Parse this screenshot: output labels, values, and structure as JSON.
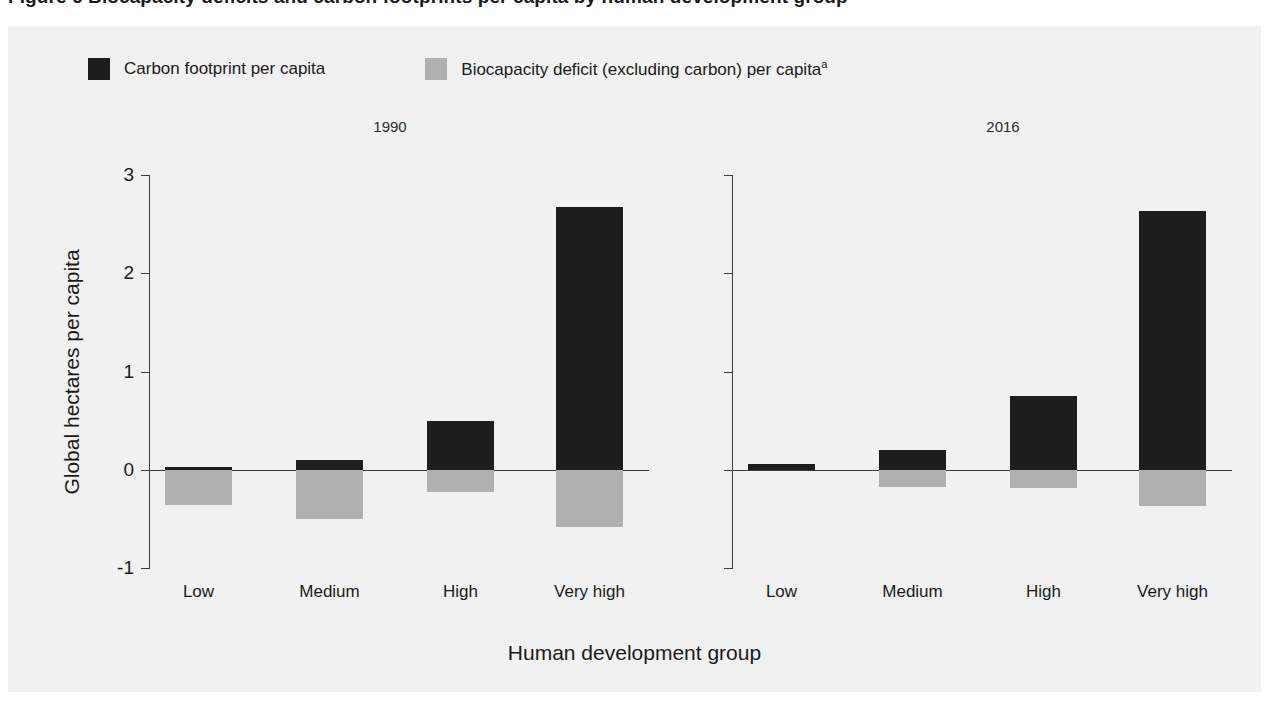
{
  "figure": {
    "title": "Figure 6  Biocapacity deficits and carbon footprints per capita by human development group",
    "xlabel": "Human development group",
    "ylabel": "Global hectares per capita"
  },
  "legend": {
    "position": "top-left",
    "items": [
      {
        "label": "Carbon footprint per capita",
        "color": "#1d1d1d",
        "superscript": ""
      },
      {
        "label": "Biocapacity deficit (excluding carbon) per capita",
        "color": "#b0b0b0",
        "superscript": "a"
      }
    ]
  },
  "colors": {
    "carbon": "#1d1d1d",
    "biocapacity": "#b0b0b0",
    "axis": "#3c3c3c",
    "background": "#f1f1f1",
    "text": "#1a1a1a"
  },
  "chart_data": {
    "type": "bar",
    "title": "Biocapacity deficits and carbon footprints per capita by human development group",
    "xlabel": "Human development group",
    "ylabel": "Global hectares per capita",
    "ylim": [
      -1,
      3
    ],
    "yticks": [
      3,
      2,
      1,
      0,
      -1
    ],
    "ytick_labels": [
      "3",
      "2",
      "1",
      "0",
      "-1"
    ],
    "grid": false,
    "legend_position": "top-left",
    "stacked": true,
    "panels": [
      {
        "title": "1990",
        "categories": [
          "Low",
          "Medium",
          "High",
          "Very high"
        ],
        "series": [
          {
            "name": "Carbon footprint per capita",
            "color": "#1d1d1d",
            "values": [
              0.03,
              0.1,
              0.5,
              2.67
            ]
          },
          {
            "name": "Biocapacity deficit (excluding carbon) per capita",
            "color": "#b0b0b0",
            "values": [
              -0.36,
              -0.5,
              -0.23,
              -0.58
            ]
          }
        ]
      },
      {
        "title": "2016",
        "categories": [
          "Low",
          "Medium",
          "High",
          "Very high"
        ],
        "series": [
          {
            "name": "Carbon footprint per capita",
            "color": "#1d1d1d",
            "values": [
              0.06,
              0.2,
              0.75,
              2.63
            ]
          },
          {
            "name": "Biocapacity deficit (excluding carbon) per capita",
            "color": "#b0b0b0",
            "values": [
              0.0,
              -0.18,
              -0.19,
              -0.37
            ]
          }
        ]
      }
    ]
  }
}
